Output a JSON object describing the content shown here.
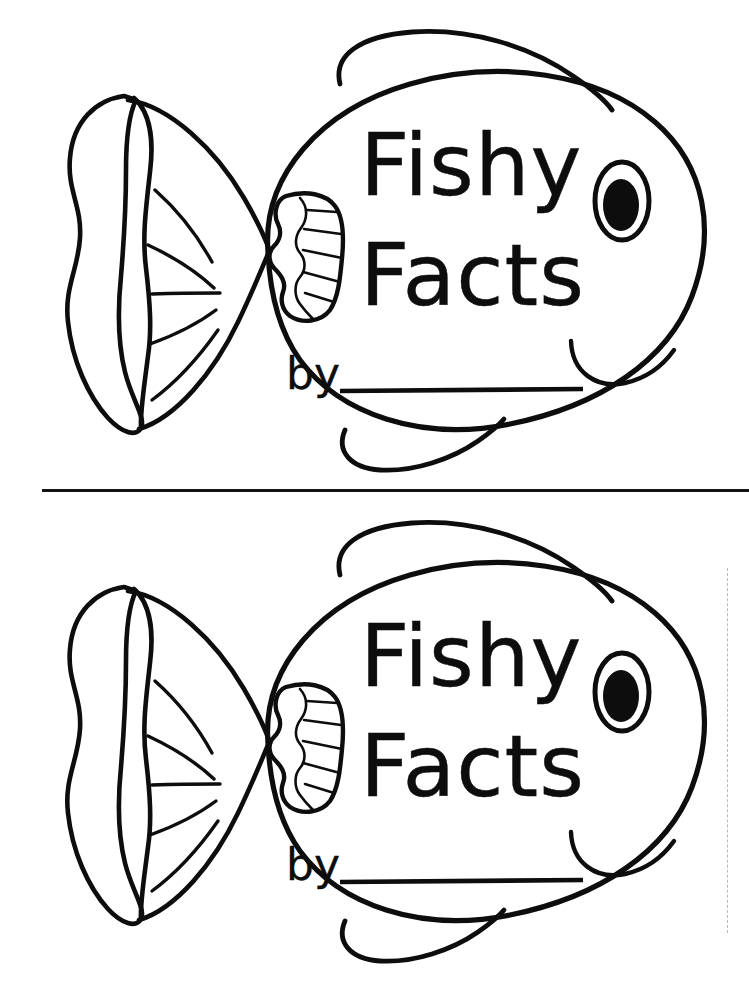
{
  "page": {
    "background_color": "#ffffff",
    "ink_color": "#0d0d0d",
    "width": 749,
    "height": 981
  },
  "divider": {
    "name": "cut-line",
    "orientation": "horizontal",
    "x": 42,
    "y": 489,
    "length": 707,
    "color": "#131313"
  },
  "cut_guide": {
    "name": "dashed-trim-guide",
    "orientation": "vertical",
    "x": 727,
    "y": 568,
    "length": 365,
    "color": "#b9b9b9",
    "style": "dashed"
  },
  "covers": [
    {
      "id": "cover-top",
      "title_line_1": "Fishy",
      "title_line_2": "Facts",
      "byline_label": "by",
      "byline_value": "",
      "byline_placeholder": ""
    },
    {
      "id": "cover-bottom",
      "title_line_1": "Fishy",
      "title_line_2": "Facts",
      "byline_label": "by",
      "byline_value": "",
      "byline_placeholder": ""
    }
  ],
  "fish_parts": {
    "body": "fish-body",
    "dorsal_fin": "dorsal-fin",
    "ventral_fin": "ventral-fin",
    "tail_fin": "tail-fin",
    "pectoral_fin": "pectoral-fin",
    "eye": "fish-eye",
    "pupil": "fish-pupil",
    "mouth": "fish-mouth"
  }
}
